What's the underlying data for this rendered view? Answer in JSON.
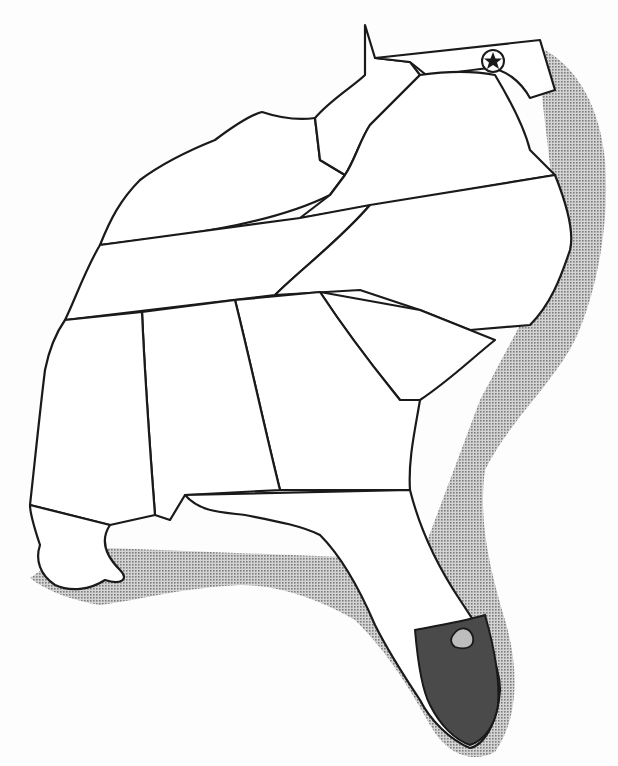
{
  "map": {
    "title": "",
    "type": "species range map",
    "region": "Southeastern United States",
    "legend": {
      "stippled_area": "coastal / offshore range (light stipple)",
      "dark_area": "southern Florida core range (dark fill)",
      "star_symbol": "Washington, D.C. (circled star)"
    },
    "colors": {
      "background": "#fdfdfd",
      "land": "#ffffff",
      "stipple": "#9a9a9a",
      "core": "#4a4a4a",
      "outline": "#1a1a1a"
    },
    "states_shown": [
      "West Virginia",
      "Maryland",
      "Delaware",
      "Virginia",
      "Kentucky",
      "Tennessee",
      "North Carolina",
      "South Carolina",
      "Georgia",
      "Alabama",
      "Mississippi",
      "Louisiana",
      "Florida"
    ],
    "markers": [
      {
        "name": "capital-star",
        "label": "Washington, D.C."
      }
    ]
  }
}
